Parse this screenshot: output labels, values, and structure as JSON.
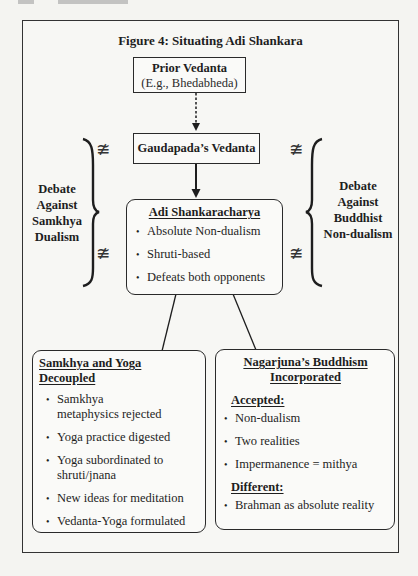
{
  "figure": {
    "title": "Figure 4: Situating Adi Shankara",
    "prior": {
      "title": "Prior Vedanta",
      "subtitle": "(E.g., Bhedabheda)"
    },
    "gaudapada": {
      "title": "Gaudapada’s Vedanta"
    },
    "shankara": {
      "title": "Adi Shankaracharya",
      "bullets": [
        "Absolute Non-dualism",
        "Shruti-based",
        "Defeats both opponents"
      ]
    },
    "left_debate": {
      "lines": [
        "Debate",
        "Against",
        "Samkhya",
        "Dualism"
      ]
    },
    "right_debate": {
      "lines": [
        "Debate",
        "Against",
        "Buddhist",
        "Non-dualism"
      ]
    },
    "symbols": {
      "not_equal": "≇",
      "left_brace": "}",
      "right_brace": "{"
    },
    "samkhya_box": {
      "title_part1": "Samkhya and Yoga",
      "title_part2": "Decoupled",
      "bullets": [
        "Samkhya metaphysics rejected",
        "Yoga practice digested",
        "Yoga subordinated to shruti/jnana",
        "New ideas for meditation",
        "Vedanta-Yoga formulated"
      ]
    },
    "nagarjuna_box": {
      "title_line1": "Nagarjuna’s Buddhism",
      "title_line2": "Incorporated",
      "accepted_label": "Accepted:",
      "accepted": [
        "Non-dualism",
        "Two realities",
        "Impermanence = mithya"
      ],
      "different_label": "Different:",
      "different": [
        "Brahman as absolute reality"
      ]
    },
    "colors": {
      "ink": "#1e1e1e",
      "page": "#f4f4f1"
    }
  }
}
